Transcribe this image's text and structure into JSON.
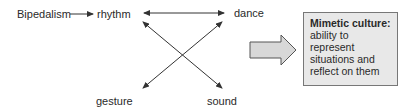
{
  "nodes": {
    "bipedalism": "Bipedalism",
    "rhythm": "rhythm",
    "dance": "dance",
    "gesture": "gesture",
    "sound": "sound"
  },
  "result_box": {
    "title": "Mimetic culture:",
    "body": "ability to represent situations and reflect on them"
  },
  "colors": {
    "line": "#333333",
    "box_fill": "#e8e8e8",
    "box_border": "#777777",
    "big_arrow_fill": "#d8d8d8"
  }
}
